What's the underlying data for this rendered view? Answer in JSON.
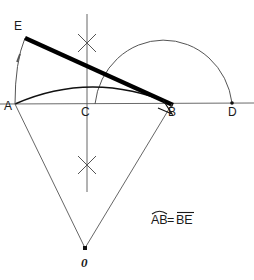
{
  "figure": {
    "type": "geometric-construction",
    "background_color": "#ffffff",
    "width": 254,
    "height": 280,
    "points": [
      {
        "id": "A",
        "label": "A",
        "x": 15,
        "y": 104,
        "label_x": 4,
        "label_y": 110
      },
      {
        "id": "B",
        "label": "B",
        "x": 172,
        "y": 104,
        "label_x": 168,
        "label_y": 115
      },
      {
        "id": "C",
        "label": "C",
        "x": 87,
        "y": 104,
        "label_x": 81,
        "label_y": 115
      },
      {
        "id": "D",
        "label": "D",
        "x": 232,
        "y": 103,
        "label_x": 228,
        "label_y": 115
      },
      {
        "id": "E",
        "label": "E",
        "x": 25,
        "y": 38,
        "label_x": 14,
        "label_y": 28
      },
      {
        "id": "O",
        "label": "0",
        "x": 85,
        "y": 248,
        "label_x": 80,
        "label_y": 266
      }
    ],
    "annotation": {
      "text_arc": "AB",
      "text_equals": "=",
      "text_seg": "BE",
      "full_text": "AB=BE",
      "x": 152,
      "y": 222
    },
    "colors": {
      "stroke_dark": "#111111",
      "stroke_thin": "#555555",
      "axis": "#6a6a6a",
      "text": "#1a1a1a",
      "background": "#ffffff"
    },
    "elements": [
      {
        "name": "baseline-AD",
        "kind": "line"
      },
      {
        "name": "perpendicular-bisector",
        "kind": "line"
      },
      {
        "name": "semicircle-arc-AD",
        "kind": "arc"
      },
      {
        "name": "rectification-arc-AB",
        "kind": "arc"
      },
      {
        "name": "arc-A-to-E",
        "kind": "arc"
      },
      {
        "name": "chord-EB",
        "kind": "thick-segment"
      },
      {
        "name": "radius-AO",
        "kind": "line"
      },
      {
        "name": "radius-BO",
        "kind": "line"
      },
      {
        "name": "right-angle-marker-B",
        "kind": "marker"
      },
      {
        "name": "construction-cross-upper",
        "kind": "marker"
      },
      {
        "name": "construction-cross-lower",
        "kind": "marker"
      }
    ]
  }
}
